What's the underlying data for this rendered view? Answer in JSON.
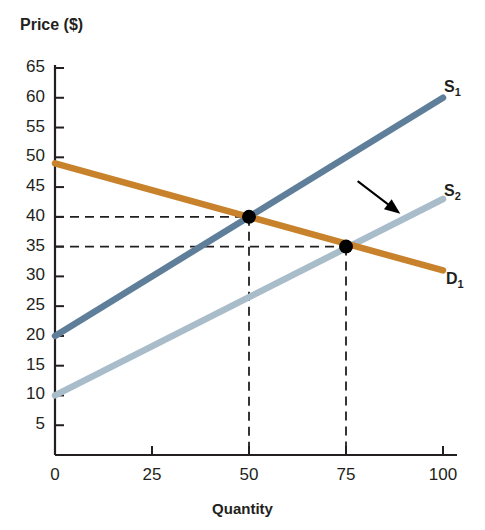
{
  "figure": {
    "title_partial": "",
    "y_axis_title": "Price ($)",
    "x_axis_title": "Quantity"
  },
  "labels": {
    "s1": "S",
    "s1_sub": "1",
    "s2": "S",
    "s2_sub": "2",
    "d1": "D",
    "d1_sub": "1"
  },
  "colors": {
    "supply_1": "#5e7e99",
    "supply_2": "#a8bcc9",
    "demand_1": "#c8822c",
    "axis": "#231f20",
    "dashed": "#231f20",
    "point": "#000000",
    "title": "#d79b4a"
  },
  "chart_data": {
    "type": "line",
    "title": "",
    "xlabel": "Quantity",
    "ylabel": "Price ($)",
    "xlim": [
      0,
      100
    ],
    "ylim": [
      0,
      67
    ],
    "xticks": [
      0,
      25,
      50,
      75,
      100
    ],
    "yticks": [
      5,
      10,
      15,
      20,
      25,
      30,
      35,
      40,
      45,
      50,
      55,
      60,
      65
    ],
    "grid": false,
    "legend": "inline-curve-labels",
    "series": [
      {
        "name": "S1",
        "label": "S₁",
        "color": "#5e7e99",
        "points": [
          [
            0,
            20
          ],
          [
            100,
            60
          ]
        ]
      },
      {
        "name": "S2",
        "label": "S₂",
        "color": "#a8bcc9",
        "points": [
          [
            0,
            10
          ],
          [
            100,
            43
          ]
        ]
      },
      {
        "name": "D1",
        "label": "D₁",
        "color": "#c8822c",
        "points": [
          [
            0,
            49
          ],
          [
            100,
            31
          ]
        ]
      }
    ],
    "annotations": [
      {
        "type": "point",
        "name": "equilibrium-1",
        "x": 50,
        "y": 40,
        "guides": [
          "horizontal-to-y-axis",
          "vertical-to-x-axis"
        ]
      },
      {
        "type": "point",
        "name": "equilibrium-2",
        "x": 75,
        "y": 35,
        "guides": [
          "horizontal-to-y-axis",
          "vertical-to-x-axis"
        ]
      },
      {
        "type": "arrow",
        "name": "supply-shift-arrow",
        "from": [
          78,
          46
        ],
        "to": [
          89,
          40.5
        ]
      }
    ]
  }
}
